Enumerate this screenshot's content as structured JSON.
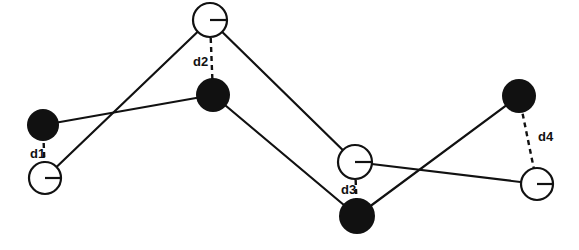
{
  "figure": {
    "title": "",
    "background_color": "#ffffff",
    "width": 579,
    "height": 250
  },
  "style": {
    "filled_node_color": "#111111",
    "open_node_stroke": "#111111",
    "open_node_fill": "#ffffff",
    "edge_color": "#111111",
    "dashed_color": "#111111",
    "label_color": "#111111"
  },
  "chart_data": {
    "type": "scatter",
    "title": "",
    "xlabel": "",
    "ylabel": "",
    "legend": [],
    "series": [
      {
        "name": "filled-nodes",
        "marker": "filled-circle",
        "points": [
          {
            "id": "f1",
            "x": 43,
            "y": 125,
            "r": 16
          },
          {
            "id": "f2",
            "x": 213,
            "y": 95,
            "r": 17
          },
          {
            "id": "f3",
            "x": 357,
            "y": 216,
            "r": 18
          },
          {
            "id": "f4",
            "x": 519,
            "y": 96,
            "r": 17
          }
        ]
      },
      {
        "name": "open-nodes",
        "marker": "open-circle",
        "points": [
          {
            "id": "o1",
            "x": 45,
            "y": 178,
            "r": 16
          },
          {
            "id": "o2",
            "x": 210,
            "y": 20,
            "r": 17
          },
          {
            "id": "o3",
            "x": 355,
            "y": 162,
            "r": 17
          },
          {
            "id": "o4",
            "x": 537,
            "y": 184,
            "r": 16
          }
        ]
      }
    ],
    "edges": [
      {
        "from": "f1",
        "to": "f2",
        "style": "solid"
      },
      {
        "from": "f2",
        "to": "f3",
        "style": "solid"
      },
      {
        "from": "f3",
        "to": "f4",
        "style": "solid"
      },
      {
        "from": "o1",
        "to": "o2",
        "style": "solid"
      },
      {
        "from": "o2",
        "to": "o3",
        "style": "solid"
      },
      {
        "from": "o3",
        "to": "o4",
        "style": "solid"
      }
    ],
    "distances": [
      {
        "label": "d1",
        "from": "f1",
        "to": "o1",
        "style": "dashed",
        "label_x": 30,
        "label_y": 155
      },
      {
        "label": "d2",
        "from": "o2",
        "to": "f2",
        "style": "dashed",
        "label_x": 193,
        "label_y": 63
      },
      {
        "label": "d3",
        "from": "o3",
        "to": "f3",
        "style": "dashed",
        "label_x": 341,
        "label_y": 191
      },
      {
        "label": "d4",
        "from": "f4",
        "to": "o4",
        "style": "dashed",
        "label_x": 538,
        "label_y": 138
      }
    ]
  },
  "labels": {
    "d1": "d1",
    "d2": "d2",
    "d3": "d3",
    "d4": "d4"
  }
}
